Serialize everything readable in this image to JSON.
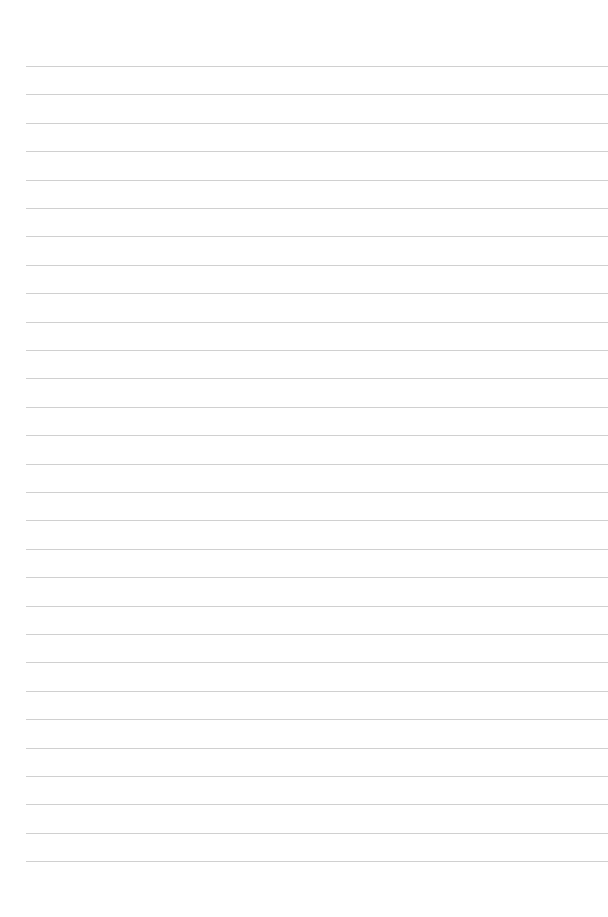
{
  "page": {
    "type": "lined-paper",
    "background_color": "#ffffff",
    "line_color": "#c8c8c8",
    "line_count": 29,
    "first_line_y": 66,
    "line_spacing": 28.4,
    "line_left_x": 26
  }
}
